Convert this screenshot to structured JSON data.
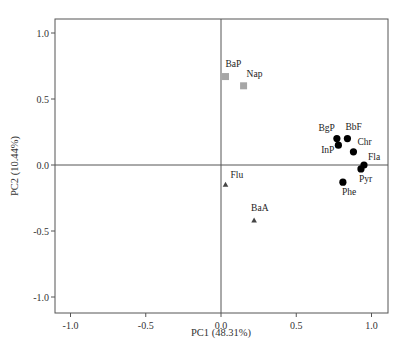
{
  "chart_data": {
    "type": "scatter",
    "title": "",
    "xlabel": "PC1 (48.31%)",
    "ylabel": "PC2 (10.44%)",
    "xlim": [
      -1.1,
      1.1
    ],
    "ylim": [
      -1.1,
      1.1
    ],
    "xticks": [
      -1.0,
      -0.5,
      0.0,
      0.5,
      1.0
    ],
    "yticks": [
      -1.0,
      -0.5,
      0.0,
      0.5,
      1.0
    ],
    "xtick_labels": [
      "-1.0",
      "-0.5",
      "0.0",
      "0.5",
      "1.0"
    ],
    "ytick_labels": [
      "-1.0",
      "-0.5",
      "0.0",
      "0.5",
      "1.0"
    ],
    "grid": false,
    "reference_lines": {
      "x": 0.0,
      "y": 0.0
    },
    "legend": null,
    "series": [
      {
        "name": "group-square",
        "marker": "square",
        "color": "#a6a6a6",
        "points": [
          {
            "label": "BaP",
            "x": 0.03,
            "y": 0.67
          },
          {
            "label": "Nap",
            "x": 0.15,
            "y": 0.6
          }
        ]
      },
      {
        "name": "group-circle",
        "marker": "circle",
        "color": "#000000",
        "points": [
          {
            "label": "BgP",
            "x": 0.77,
            "y": 0.2
          },
          {
            "label": "BbF",
            "x": 0.84,
            "y": 0.2
          },
          {
            "label": "InP",
            "x": 0.78,
            "y": 0.15
          },
          {
            "label": "Chr",
            "x": 0.88,
            "y": 0.1
          },
          {
            "label": "Fla",
            "x": 0.95,
            "y": 0.0
          },
          {
            "label": "Pyr",
            "x": 0.93,
            "y": -0.03
          },
          {
            "label": "Phe",
            "x": 0.81,
            "y": -0.13
          }
        ]
      },
      {
        "name": "group-triangle",
        "marker": "triangle",
        "color": "#444444",
        "points": [
          {
            "label": "Flu",
            "x": 0.03,
            "y": -0.15
          },
          {
            "label": "BaA",
            "x": 0.22,
            "y": -0.42
          }
        ]
      }
    ]
  },
  "labels": {
    "xlabel": "PC1 (48.31%)",
    "ylabel": "PC2 (10.44%)"
  }
}
